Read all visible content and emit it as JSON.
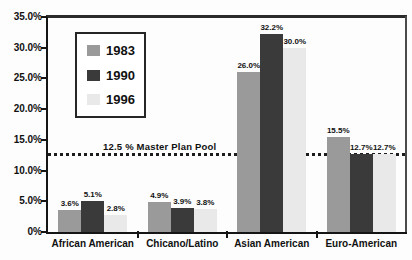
{
  "chart_data": {
    "type": "bar",
    "title": "",
    "categories": [
      "African American",
      "Chicano/Latino",
      "Asian American",
      "Euro-American"
    ],
    "series": [
      {
        "name": "1983",
        "color": "#9a9a9a",
        "values": [
          3.6,
          4.9,
          26.0,
          15.5
        ],
        "labels": [
          "3.6%",
          "4.9%",
          "26.0%",
          "15.5%"
        ]
      },
      {
        "name": "1990",
        "color": "#3a3a3a",
        "values": [
          5.1,
          3.9,
          32.2,
          12.7
        ],
        "labels": [
          "5.1%",
          "3.9%",
          "32.2%",
          "12.7%"
        ]
      },
      {
        "name": "1996",
        "color": "#e9e9e9",
        "values": [
          2.8,
          3.8,
          30.0,
          12.7
        ],
        "labels": [
          "2.8%",
          "3.8%",
          "30.0%",
          "12.7%"
        ]
      }
    ],
    "y_axis": {
      "min": 0,
      "max": 35,
      "tick_step": 5,
      "tick_labels": [
        "35.0%",
        "30.0%",
        "25.0%",
        "20.0%",
        "15.0%",
        "10.0%",
        "5.0%",
        "0%"
      ]
    },
    "reference_line": {
      "value": 12.5,
      "label": "12.5 % Master Plan Pool",
      "style": "dotted",
      "color": "#1c1c1c"
    },
    "legend": {
      "position": "upper-left",
      "entries": [
        "1983",
        "1990",
        "1996"
      ]
    },
    "grid": false,
    "xlabel": "",
    "ylabel": ""
  }
}
